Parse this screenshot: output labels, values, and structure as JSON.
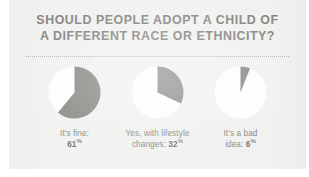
{
  "card": {
    "background_color": "#f1f1ef",
    "headline_lines": [
      "SHOULD PEOPLE ADOPT A CHILD OF",
      "A DIFFERENT RACE OR ETHNICITY?"
    ],
    "headline_color": "#868683",
    "divider": "dotted-rule"
  },
  "chart_data": {
    "type": "pie",
    "title": "SHOULD PEOPLE ADOPT A CHILD OF A DIFFERENT RACE OR ETHNICITY?",
    "xlabel": "",
    "ylabel": "",
    "grid": false,
    "legend_position": "below-each-pie",
    "slice_color": "#8c8c89",
    "remainder_color": "#fdfdfc",
    "units": "%",
    "categories": [
      "It's fine",
      "Yes, with lifestyle changes",
      "It's a bad idea"
    ],
    "values": [
      61,
      32,
      6
    ],
    "slices": [
      {
        "label_line1": "It's fine:",
        "label_line2_prefix": "",
        "value": "61",
        "percent_sign": "%",
        "fraction": 0.61,
        "start_angle_deg": 0,
        "sweep_deg": 219.6
      },
      {
        "label_line1": "Yes, with lifestyle",
        "label_line2_prefix": "changes: ",
        "value": "32",
        "percent_sign": "%",
        "fraction": 0.32,
        "start_angle_deg": 0,
        "sweep_deg": 115.2
      },
      {
        "label_line1": "It's a bad",
        "label_line2_prefix": "idea: ",
        "value": "6",
        "percent_sign": "%",
        "fraction": 0.06,
        "start_angle_deg": 0,
        "sweep_deg": 21.6
      }
    ]
  }
}
